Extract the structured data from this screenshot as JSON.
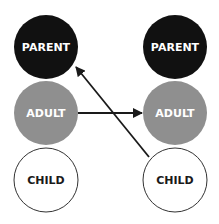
{
  "diagram": {
    "columns": [
      {
        "nodes": [
          {
            "label": "PARENT",
            "fill": "#111111",
            "text_color": "#ffffff"
          },
          {
            "label": "ADULT",
            "fill": "#8f8f8f",
            "text_color": "#ffffff"
          },
          {
            "label": "CHILD",
            "fill": "#ffffff",
            "text_color": "#1a1a1a"
          }
        ]
      },
      {
        "nodes": [
          {
            "label": "PARENT",
            "fill": "#111111",
            "text_color": "#ffffff"
          },
          {
            "label": "ADULT",
            "fill": "#8f8f8f",
            "text_color": "#ffffff"
          },
          {
            "label": "CHILD",
            "fill": "#ffffff",
            "text_color": "#1a1a1a"
          }
        ]
      }
    ],
    "arrows": [
      {
        "from": "left.ADULT",
        "to": "right.ADULT"
      },
      {
        "from": "right.CHILD",
        "to": "left.PARENT"
      }
    ]
  }
}
